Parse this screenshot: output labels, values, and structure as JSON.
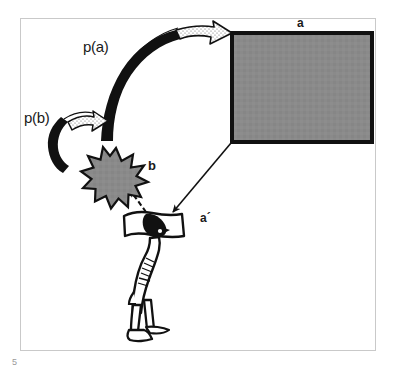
{
  "page": {
    "page_number": "5",
    "background_color": "#ffffff",
    "frame_color": "#c9c9c9"
  },
  "diagram": {
    "title": "",
    "type": "conceptual-perception-diagram",
    "palette": {
      "ink": "#1a1a1a",
      "gray_fill": "#8a8a8a",
      "outline": "#111111",
      "white": "#ffffff"
    },
    "labels": {
      "p_a": "p(a)",
      "p_b": "p(b)",
      "object_a": "a",
      "percept_b": "b",
      "percept_a_prime": "a´"
    },
    "nodes": [
      {
        "name": "object-rectangle",
        "label": "a",
        "shape": "rectangle",
        "fill": "#8a8a8a",
        "stroke": "#111111",
        "x": 232,
        "y": 33,
        "width": 140,
        "height": 109
      },
      {
        "name": "percept-starburst",
        "label": "b",
        "shape": "starburst",
        "fill": "#8a8a8a",
        "stroke": "#111111",
        "cx": 116,
        "cy": 173,
        "radius": 23
      },
      {
        "name": "observer-figure",
        "label": "",
        "shape": "person-silhouette",
        "fill": "#ffffff",
        "stroke": "#111111",
        "cx": 155,
        "cy": 275
      }
    ],
    "arrows": [
      {
        "name": "arrow-p-a",
        "label": "p(a)",
        "style": "thick-curved-ribbon",
        "from": "observer",
        "to": "object-rectangle"
      },
      {
        "name": "arrow-p-b",
        "label": "p(b)",
        "style": "thick-curved-ribbon",
        "from": "percept-starburst",
        "to": "upper-left"
      },
      {
        "name": "arrow-object-to-observer",
        "label": "",
        "style": "thin-solid",
        "from": "object-rectangle",
        "to": "observer-figure"
      },
      {
        "name": "arrow-observer-to-percept",
        "label": "",
        "style": "dashed",
        "from": "observer-figure",
        "to": "percept-starburst"
      }
    ]
  }
}
